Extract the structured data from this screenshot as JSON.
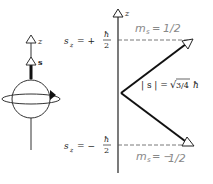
{
  "left_figure": {
    "z_axis_label": "z",
    "spin_vector_label": "s"
  },
  "right_figure": {
    "axis_label": "z",
    "upper_level": {
      "label_prefix": "s",
      "label_sub": "z",
      "label_eq": "= +",
      "frac_num": "ħ",
      "frac_den": "2",
      "handwritten": "m_s = ½",
      "hand_text": "m",
      "hand_sub": "s",
      "hand_eq": "= ",
      "hand_val": "1/2"
    },
    "lower_level": {
      "label_prefix": "s",
      "label_sub": "z",
      "label_eq": "= −",
      "frac_num": "ħ",
      "frac_den": "2",
      "handwritten": "m_s = −½",
      "hand_text": "m",
      "hand_sub": "s",
      "hand_eq": "= −",
      "hand_val": "1/2"
    },
    "magnitude_label": {
      "left": "| s | =",
      "sqrt": "√",
      "radicand": "3/4",
      "unit": "ħ"
    }
  }
}
